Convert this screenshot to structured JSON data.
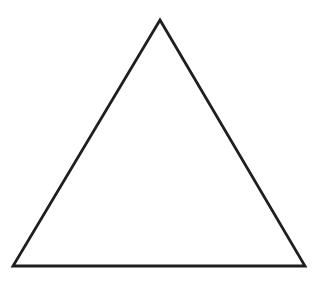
{
  "canvas": {
    "width": 319,
    "height": 283,
    "background_color": "#ffffff",
    "description": "Plain white background containing a single unfilled triangle outline"
  },
  "figure": {
    "name": "triangle",
    "type": "polygon",
    "sides": 3,
    "filled": false,
    "stroke_color": "#1f1f1f",
    "stroke_width": 2.8,
    "fill_color": "none",
    "points": "160,20 305,266 13,266",
    "vertices": [
      {
        "label": "apex",
        "x": 160,
        "y": 20
      },
      {
        "label": "bottom-right",
        "x": 305,
        "y": 266
      },
      {
        "label": "bottom-left",
        "x": 13,
        "y": 266
      }
    ],
    "base_width": 292,
    "height": 246
  }
}
